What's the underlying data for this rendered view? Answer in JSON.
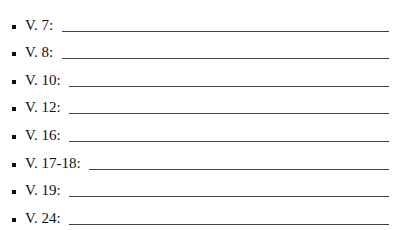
{
  "worksheet": {
    "items": [
      {
        "label": "V. 7:",
        "answer": ""
      },
      {
        "label": "V. 8:",
        "answer": ""
      },
      {
        "label": "V. 10:",
        "answer": ""
      },
      {
        "label": "V. 12:",
        "answer": ""
      },
      {
        "label": "V. 16:",
        "answer": ""
      },
      {
        "label": "V. 17-18:",
        "answer": ""
      },
      {
        "label": "V. 19:",
        "answer": ""
      },
      {
        "label": "V. 24:",
        "answer": ""
      }
    ]
  }
}
